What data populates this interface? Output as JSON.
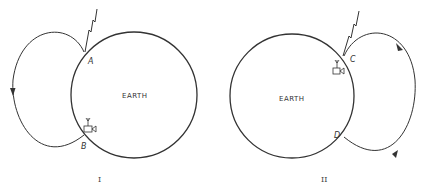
{
  "figure": {
    "panels": [
      {
        "id": "I",
        "roman_label": "I",
        "earth_label": "EARTH",
        "points": [
          "A",
          "B"
        ],
        "icons": [
          "lightning-icon",
          "radio-receiver-icon"
        ],
        "loop_side": "left",
        "arrow_direction": "down"
      },
      {
        "id": "II",
        "roman_label": "II",
        "earth_label": "EARTH",
        "points": [
          "C",
          "D"
        ],
        "icons": [
          "lightning-icon",
          "radio-receiver-icon"
        ],
        "loop_side": "right",
        "arrow_direction": "clockwise"
      }
    ],
    "colors": {
      "stroke": "#333333",
      "background": "#ffffff"
    }
  }
}
